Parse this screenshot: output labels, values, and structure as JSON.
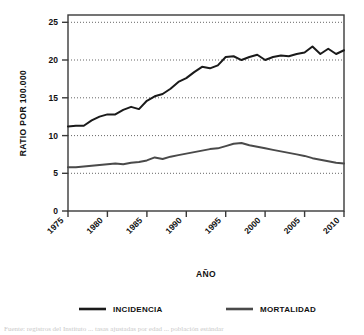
{
  "chart_data": {
    "type": "line",
    "title": "",
    "xlabel": "AÑO",
    "ylabel": "RATIO POR 100.000",
    "xlim": [
      1975,
      2010
    ],
    "ylim": [
      0,
      26
    ],
    "yticks": [
      0,
      5,
      10,
      15,
      20,
      25
    ],
    "ytick_labels": [
      "0",
      "5",
      "10",
      "15",
      "20",
      "25"
    ],
    "xticks": [
      1975,
      1980,
      1985,
      1990,
      1995,
      2000,
      2005,
      2010
    ],
    "xtick_labels": [
      "1975",
      "1980",
      "1985",
      "1990",
      "1995",
      "2000",
      "2005",
      "2010"
    ],
    "grid": "horizontal-dotted",
    "legend_position": "bottom",
    "x": [
      1975,
      1976,
      1977,
      1978,
      1979,
      1980,
      1981,
      1982,
      1983,
      1984,
      1985,
      1986,
      1987,
      1988,
      1989,
      1990,
      1991,
      1992,
      1993,
      1994,
      1995,
      1996,
      1997,
      1998,
      1999,
      2000,
      2001,
      2002,
      2003,
      2004,
      2005,
      2006,
      2007,
      2008,
      2009,
      2010
    ],
    "series": [
      {
        "name": "INCIDENCIA",
        "color": "#1a1a1a",
        "values": [
          11.2,
          11.3,
          11.3,
          12.0,
          12.5,
          12.8,
          12.8,
          13.4,
          13.8,
          13.5,
          14.6,
          15.2,
          15.5,
          16.2,
          17.1,
          17.6,
          18.4,
          19.1,
          18.9,
          19.3,
          20.4,
          20.5,
          20.0,
          20.4,
          20.7,
          20.0,
          20.4,
          20.6,
          20.5,
          20.8,
          21.0,
          21.8,
          20.8,
          21.5,
          20.8,
          21.3
        ]
      },
      {
        "name": "MORTALIDAD",
        "color": "#4a4a4a",
        "values": [
          5.8,
          5.8,
          5.9,
          6.0,
          6.1,
          6.2,
          6.3,
          6.2,
          6.4,
          6.5,
          6.7,
          7.1,
          6.9,
          7.2,
          7.4,
          7.6,
          7.8,
          8.0,
          8.2,
          8.3,
          8.6,
          8.9,
          9.0,
          8.7,
          8.5,
          8.3,
          8.1,
          7.9,
          7.7,
          7.5,
          7.3,
          7.0,
          6.8,
          6.6,
          6.4,
          6.3
        ]
      }
    ]
  },
  "legend": {
    "entries": [
      {
        "label": "INCIDENCIA",
        "color": "#1a1a1a"
      },
      {
        "label": "MORTALIDAD",
        "color": "#4a4a4a"
      }
    ]
  },
  "caption_sliver": "Fuente: registros del Instituto ... tasas ajustadas por edad ... población estándar"
}
